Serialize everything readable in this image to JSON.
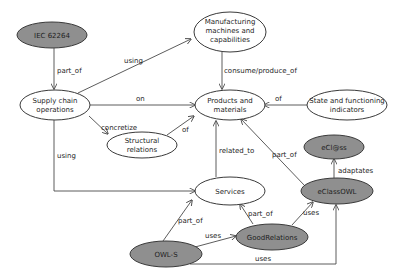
{
  "colors": {
    "light_node": "#ffffff",
    "dark_node": "#8f8f8f",
    "stroke": "#3a3a3a"
  },
  "nodes": {
    "iec": {
      "lines": [
        "IEC 62264"
      ],
      "style": "dark"
    },
    "manufacturing": {
      "lines": [
        "Manufacturing",
        "machines and",
        "capabilities"
      ],
      "style": "light"
    },
    "supply": {
      "lines": [
        "Supply chain",
        "operations"
      ],
      "style": "light"
    },
    "products": {
      "lines": [
        "Products and",
        "materials"
      ],
      "style": "light"
    },
    "state": {
      "lines": [
        "State and functioning",
        "indicators"
      ],
      "style": "light"
    },
    "structural": {
      "lines": [
        "Structural",
        "relations"
      ],
      "style": "light"
    },
    "services": {
      "lines": [
        "Services"
      ],
      "style": "light"
    },
    "eclass": {
      "lines": [
        "eCl@ss"
      ],
      "style": "dark"
    },
    "eclassowl": {
      "lines": [
        "eClassOWL"
      ],
      "style": "dark"
    },
    "goodrelations": {
      "lines": [
        "GoodRelations"
      ],
      "style": "dark"
    },
    "owls": {
      "lines": [
        "OWL-S"
      ],
      "style": "dark"
    }
  },
  "edges": [
    {
      "from": "iec",
      "to": "supply",
      "label": "part_of"
    },
    {
      "from": "supply",
      "to": "manufacturing",
      "label": "using"
    },
    {
      "from": "manufacturing",
      "to": "products",
      "label": "consume/produce_of"
    },
    {
      "from": "supply",
      "to": "products",
      "label": "on"
    },
    {
      "from": "state",
      "to": "products",
      "label": "of"
    },
    {
      "from": "supply",
      "to": "structural",
      "label": "concretize"
    },
    {
      "from": "structural",
      "to": "products",
      "label": "of"
    },
    {
      "from": "supply",
      "to": "services",
      "label": "using"
    },
    {
      "from": "services",
      "to": "products",
      "label": "related_to"
    },
    {
      "from": "eclassowl",
      "to": "products",
      "label": "part_of"
    },
    {
      "from": "eclassowl",
      "to": "eclass",
      "label": "adaptates"
    },
    {
      "from": "owls",
      "to": "services",
      "label": "part_of"
    },
    {
      "from": "goodrelations",
      "to": "services",
      "label": "part_of"
    },
    {
      "from": "goodrelations",
      "to": "eclassowl",
      "label": "uses"
    },
    {
      "from": "owls",
      "to": "goodrelations",
      "label": "uses"
    },
    {
      "from": "owls",
      "to": "eclassowl",
      "label": "uses"
    }
  ]
}
